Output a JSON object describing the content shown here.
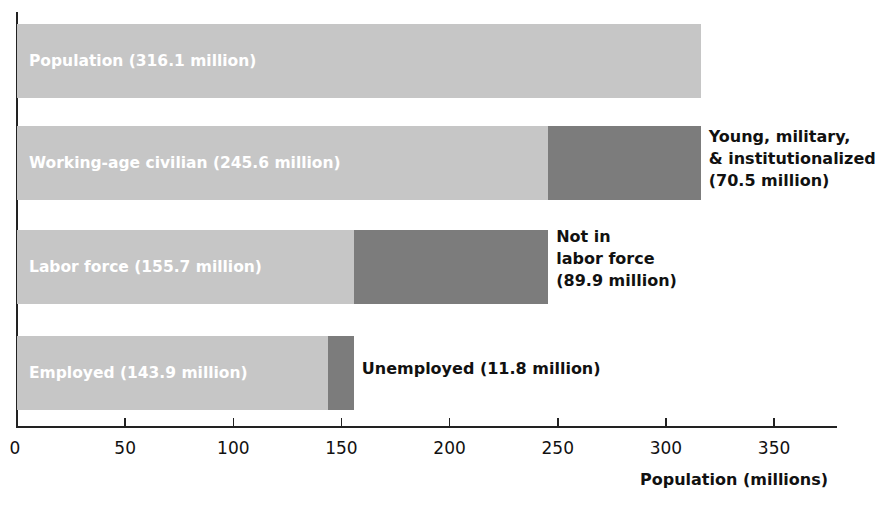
{
  "chart_data": {
    "type": "bar",
    "orientation": "horizontal-stacked",
    "title": "",
    "xlabel": "Population (millions)",
    "ylabel": "",
    "xlim": [
      0,
      375
    ],
    "xticks": [
      0,
      50,
      100,
      150,
      200,
      250,
      300,
      350
    ],
    "grid": false,
    "categories": [
      "Population",
      "Working-age civilian",
      "Labor force",
      "Employed"
    ],
    "series": [
      {
        "name": "Included",
        "values": [
          316.1,
          245.6,
          155.7,
          143.9
        ]
      },
      {
        "name": "Excluded",
        "values": [
          0,
          70.5,
          89.9,
          11.8
        ]
      }
    ],
    "bars": [
      {
        "label": "Population (316.1 million)",
        "value": 316.1,
        "excluded": 0,
        "annotation": ""
      },
      {
        "label": "Working-age civilian (245.6 million)",
        "value": 245.6,
        "excluded": 70.5,
        "annotation": "Young, military,\n& institutionalized\n(70.5 million)"
      },
      {
        "label": "Labor force (155.7 million)",
        "value": 155.7,
        "excluded": 89.9,
        "annotation": "Not in\nlabor force\n(89.9 million)"
      },
      {
        "label": "Employed (143.9 million)",
        "value": 143.9,
        "excluded": 11.8,
        "annotation": "Unemployed (11.8 million)"
      }
    ],
    "colors": {
      "light": "#c6c6c6",
      "dark": "#7c7c7c",
      "label_text": "#ffffff",
      "annotation_text": "#111111"
    }
  }
}
